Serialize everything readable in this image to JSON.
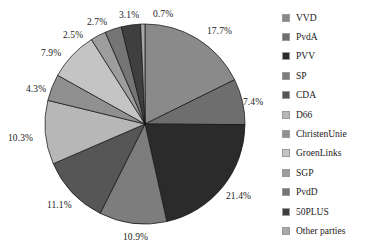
{
  "chart_data": {
    "type": "pie",
    "title": "",
    "subtitle": "",
    "xlabel": "",
    "ylabel": "",
    "grid": false,
    "legend_position": "right",
    "start_angle_deg": 90,
    "direction": "clockwise",
    "value_unit": "percent",
    "categories": [
      "VVD",
      "PvdA",
      "PVV",
      "SP",
      "CDA",
      "D66",
      "ChristenUnie",
      "GroenLinks",
      "SGP",
      "PvdD",
      "50PLUS",
      "Other parties"
    ],
    "values": [
      17.7,
      7.4,
      21.4,
      10.9,
      11.1,
      10.3,
      4.3,
      7.9,
      2.5,
      2.7,
      3.1,
      0.7
    ],
    "labels": [
      "17.7%",
      "7.4%",
      "21.4%",
      "10.9%",
      "11.1%",
      "10.3%",
      "4.3%",
      "7.9%",
      "2.5%",
      "2.7%",
      "3.1%",
      "0.7%"
    ],
    "colors": [
      "#8a8a8a",
      "#6e6e6e",
      "#2b2b2b",
      "#7d7d7d",
      "#565656",
      "#b7b7b7",
      "#909090",
      "#c4c4c4",
      "#9d9d9d",
      "#757575",
      "#3f3f3f",
      "#a8a8a8"
    ],
    "slices": [
      {
        "name": "VVD",
        "value": 17.7,
        "label": "17.7%",
        "color": "#8a8a8a",
        "label_x": 207,
        "label_y": 26
      },
      {
        "name": "PvdA",
        "value": 7.4,
        "label": "7.4%",
        "color": "#6e6e6e",
        "label_x": 243,
        "label_y": 97
      },
      {
        "name": "PVV",
        "value": 21.4,
        "label": "21.4%",
        "color": "#2b2b2b",
        "label_x": 226,
        "label_y": 191
      },
      {
        "name": "SP",
        "value": 10.9,
        "label": "10.9%",
        "color": "#7d7d7d",
        "label_x": 123,
        "label_y": 232
      },
      {
        "name": "CDA",
        "value": 11.1,
        "label": "11.1%",
        "color": "#565656",
        "label_x": 47,
        "label_y": 200
      },
      {
        "name": "D66",
        "value": 10.3,
        "label": "10.3%",
        "color": "#b7b7b7",
        "label_x": 8,
        "label_y": 133
      },
      {
        "name": "ChristenUnie",
        "value": 4.3,
        "label": "4.3%",
        "color": "#909090",
        "label_x": 26,
        "label_y": 84
      },
      {
        "name": "GroenLinks",
        "value": 7.9,
        "label": "7.9%",
        "color": "#c4c4c4",
        "label_x": 41,
        "label_y": 48
      },
      {
        "name": "SGP",
        "value": 2.5,
        "label": "2.5%",
        "color": "#9d9d9d",
        "label_x": 63,
        "label_y": 30
      },
      {
        "name": "PvdD",
        "value": 2.7,
        "label": "2.7%",
        "color": "#757575",
        "label_x": 87,
        "label_y": 17
      },
      {
        "name": "50PLUS",
        "value": 3.1,
        "label": "3.1%",
        "color": "#3f3f3f",
        "label_x": 119,
        "label_y": 10
      },
      {
        "name": "Other parties",
        "value": 0.7,
        "label": "0.7%",
        "color": "#a8a8a8",
        "label_x": 153,
        "label_y": 9
      }
    ]
  },
  "legend": {
    "items": [
      {
        "label": "VVD",
        "color": "#8a8a8a"
      },
      {
        "label": "PvdA",
        "color": "#6e6e6e"
      },
      {
        "label": "PVV",
        "color": "#2b2b2b"
      },
      {
        "label": "SP",
        "color": "#7d7d7d"
      },
      {
        "label": "CDA",
        "color": "#565656"
      },
      {
        "label": "D66",
        "color": "#b7b7b7"
      },
      {
        "label": "ChristenUnie",
        "color": "#909090"
      },
      {
        "label": "GroenLinks",
        "color": "#c4c4c4"
      },
      {
        "label": "SGP",
        "color": "#9d9d9d"
      },
      {
        "label": "PvdD",
        "color": "#757575"
      },
      {
        "label": "50PLUS",
        "color": "#3f3f3f"
      },
      {
        "label": "Other parties",
        "color": "#a8a8a8"
      }
    ]
  },
  "geometry": {
    "center_x": 145,
    "center_y": 124,
    "radius": 100
  }
}
